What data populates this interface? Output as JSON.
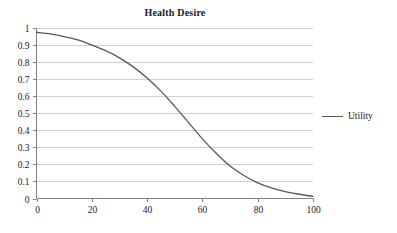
{
  "chart_data": {
    "type": "line",
    "title": "Health Desire",
    "xlabel": "",
    "ylabel": "",
    "xlim": [
      0,
      100
    ],
    "ylim": [
      0,
      1
    ],
    "grid": "horizontal",
    "legend_position": "right",
    "legend": [
      "Utility"
    ],
    "series": [
      {
        "name": "Utility",
        "color": "#595959",
        "x": [
          0,
          5,
          10,
          15,
          20,
          25,
          30,
          35,
          40,
          45,
          50,
          55,
          60,
          65,
          70,
          75,
          80,
          85,
          90,
          95,
          100
        ],
        "values": [
          0.975,
          0.965,
          0.95,
          0.93,
          0.9,
          0.867,
          0.825,
          0.772,
          0.707,
          0.63,
          0.54,
          0.445,
          0.35,
          0.265,
          0.19,
          0.135,
          0.092,
          0.062,
          0.04,
          0.025,
          0.012
        ]
      }
    ],
    "x_ticks": [
      {
        "value": 0,
        "label": "0"
      },
      {
        "value": 20,
        "label": "20"
      },
      {
        "value": 40,
        "label": "40"
      },
      {
        "value": 60,
        "label": "60"
      },
      {
        "value": 80,
        "label": "80"
      },
      {
        "value": 100,
        "label": "100"
      }
    ],
    "y_ticks": [
      {
        "value": 1,
        "label": "1"
      },
      {
        "value": 0.9,
        "label": "0.9"
      },
      {
        "value": 0.8,
        "label": "0.8"
      },
      {
        "value": 0.7,
        "label": "0.7"
      },
      {
        "value": 0.6,
        "label": "0.6"
      },
      {
        "value": 0.5,
        "label": "0.5"
      },
      {
        "value": 0.4,
        "label": "0.4"
      },
      {
        "value": 0.3,
        "label": "0.3"
      },
      {
        "value": 0.2,
        "label": "0.2"
      },
      {
        "value": 0.1,
        "label": "0.1"
      },
      {
        "value": 0,
        "label": "0"
      }
    ],
    "colors": {
      "series_line": "#595959",
      "gridline": "#d0d0d0",
      "axis_line": "#808080",
      "text": "#1a1a1a",
      "background": "#ffffff"
    }
  },
  "legend": {
    "utility_label": "Utility"
  }
}
